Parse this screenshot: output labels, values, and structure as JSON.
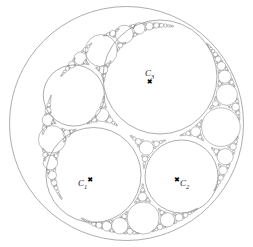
{
  "figure": {
    "background_color": "#ffffff",
    "stroke_color": "#8a8a8a",
    "label_color": "#1a1a1a",
    "marker_color": "#000000",
    "marker_glyph": "✖"
  },
  "labels": {
    "c1": {
      "base": "C",
      "sub": "1",
      "marker": "✖"
    },
    "c2": {
      "base": "C",
      "sub": "2",
      "marker": "✖"
    },
    "c3": {
      "base": "C",
      "sub": "3",
      "marker": "✖"
    }
  },
  "chart_data": {
    "type": "scatter",
    "xlabel": "",
    "ylabel": "",
    "xlim": [
      0,
      253
    ],
    "ylim": [
      0,
      247
    ],
    "grid": false,
    "legend": "none",
    "outer_circle": {
      "cx": 126.5,
      "cy": 123.5,
      "r": 117.0,
      "label": ""
    },
    "labeled_circles": [
      {
        "name": "C3",
        "cx": 160.0,
        "cy": 77.0,
        "r": 57.0,
        "marker_x": 153.0,
        "marker_y": 80.0
      },
      {
        "name": "C1",
        "cx": 93.5,
        "cy": 175.0,
        "r": 47.5,
        "marker_x": 94.0,
        "marker_y": 176.0
      },
      {
        "name": "C2",
        "cx": 181.5,
        "cy": 176.5,
        "r": 36.5,
        "marker_x": 181.0,
        "marker_y": 177.0
      }
    ],
    "circles": [
      {
        "cx": 126.5,
        "cy": 123.5,
        "r": 117.0,
        "level": 0
      },
      {
        "cx": 160.0,
        "cy": 77.0,
        "r": 57.0,
        "level": 1
      },
      {
        "cx": 93.5,
        "cy": 175.0,
        "r": 47.5,
        "level": 1
      },
      {
        "cx": 181.5,
        "cy": 176.5,
        "r": 36.5,
        "level": 1
      },
      {
        "cx": 71.0,
        "cy": 84.0,
        "r": 33.0,
        "level": 2
      },
      {
        "cx": 217.0,
        "cy": 133.0,
        "r": 22.0,
        "level": 2
      },
      {
        "cx": 142.0,
        "cy": 219.0,
        "r": 20.0,
        "level": 2
      },
      {
        "cx": 73.0,
        "cy": 43.0,
        "r": 17.0,
        "level": 3
      },
      {
        "cx": 97.0,
        "cy": 27.0,
        "r": 11.0,
        "level": 3
      },
      {
        "cx": 214.0,
        "cy": 91.0,
        "r": 10.0,
        "level": 3
      },
      {
        "cx": 221.0,
        "cy": 166.0,
        "r": 10.0,
        "level": 3
      },
      {
        "cx": 49.0,
        "cy": 130.0,
        "r": 11.5,
        "level": 3
      },
      {
        "cx": 44.0,
        "cy": 57.0,
        "r": 9.0,
        "level": 3
      },
      {
        "cx": 40.0,
        "cy": 110.0,
        "r": 7.5,
        "level": 4
      },
      {
        "cx": 104.0,
        "cy": 225.0,
        "r": 11.0,
        "level": 3
      },
      {
        "cx": 176.0,
        "cy": 218.0,
        "r": 9.0,
        "level": 3
      },
      {
        "cx": 55.0,
        "cy": 158.0,
        "r": 8.0,
        "level": 4
      },
      {
        "cx": 199.0,
        "cy": 61.0,
        "r": 7.0,
        "level": 4
      },
      {
        "cx": 230.0,
        "cy": 113.0,
        "r": 6.0,
        "level": 4
      },
      {
        "cx": 229.0,
        "cy": 152.0,
        "r": 5.5,
        "level": 4
      },
      {
        "cx": 117.0,
        "cy": 15.0,
        "r": 5.5,
        "level": 4
      },
      {
        "cx": 57.0,
        "cy": 28.0,
        "r": 5.5,
        "level": 4
      },
      {
        "cx": 86.0,
        "cy": 236.0,
        "r": 6.0,
        "level": 4
      },
      {
        "cx": 196.0,
        "cy": 206.0,
        "r": 6.5,
        "level": 4
      },
      {
        "cx": 119.0,
        "cy": 108.0,
        "r": 6.5,
        "level": 3
      },
      {
        "cx": 150.0,
        "cy": 146.0,
        "r": 7.5,
        "level": 3
      },
      {
        "cx": 133.0,
        "cy": 192.0,
        "r": 5.0,
        "level": 4
      },
      {
        "cx": 105.0,
        "cy": 47.0,
        "r": 5.0,
        "level": 4
      },
      {
        "cx": 32.0,
        "cy": 92.0,
        "r": 4.0,
        "level": 5
      },
      {
        "cx": 35.0,
        "cy": 145.0,
        "r": 4.0,
        "level": 5
      },
      {
        "cx": 65.0,
        "cy": 192.0,
        "r": 5.0,
        "level": 5
      },
      {
        "cx": 210.0,
        "cy": 193.0,
        "r": 4.0,
        "level": 5
      },
      {
        "cx": 235.0,
        "cy": 131.0,
        "r": 3.5,
        "level": 5
      },
      {
        "cx": 206.0,
        "cy": 77.0,
        "r": 3.5,
        "level": 5
      },
      {
        "cx": 135.0,
        "cy": 20.0,
        "r": 3.5,
        "level": 5
      },
      {
        "cx": 44.0,
        "cy": 38.0,
        "r": 3.5,
        "level": 5
      },
      {
        "cx": 160.0,
        "cy": 226.0,
        "r": 4.5,
        "level": 5
      },
      {
        "cx": 120.0,
        "cy": 231.0,
        "r": 4.5,
        "level": 5
      },
      {
        "cx": 70.0,
        "cy": 228.0,
        "r": 3.5,
        "level": 5
      }
    ]
  }
}
